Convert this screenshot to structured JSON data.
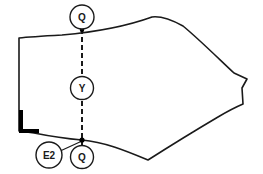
{
  "drawing": {
    "title": "Garment panel pattern piece with annotation balloons",
    "type": "technical-pattern-outline",
    "background_color": "#ffffff",
    "outline_color": "#1a1a1a",
    "balloon_fill": "#ffffff",
    "notch_color": "#000000",
    "dashed_line_color": "#1a1a1a",
    "outline": {
      "stroke_width": 1.6,
      "path": "M 19,38 L 19,131 L 34,133 C 54,137 70,139 82,140 C 104,142 124,150 148,160 C 170,146 196,130 218,117 C 228,111 236,107 243,104 L 242,88 L 247,79 L 234,73 C 222,62 200,40 183,26 C 172,20 160,16 152,17 C 130,25 96,32 62,35 C 44,36 28,37 19,38 Z"
    },
    "notch_mark": {
      "label": "corner-notch",
      "vertical": {
        "x": 19,
        "y": 110,
        "width": 4,
        "height": 23
      },
      "horizontal": {
        "x": 19,
        "y": 129,
        "width": 20,
        "height": 4
      }
    },
    "dashed_line": {
      "label": "construction-line",
      "x": 82,
      "y1": 29,
      "y2": 145,
      "dash": "5 3",
      "stroke_width": 2
    },
    "leader_line": {
      "label": "e2-leader",
      "from_x": 58,
      "from_y": 152,
      "to_x": 82,
      "to_y": 141,
      "stroke_width": 1.2
    },
    "endpoints": [
      {
        "name": "top-endpoint-marker",
        "x": 82,
        "y": 30,
        "r": 2.2
      },
      {
        "name": "bottom-endpoint-marker",
        "x": 82,
        "y": 140,
        "r": 2.6
      }
    ],
    "balloons": [
      {
        "id": "balloon-q-top",
        "label": "Q",
        "cx": 82,
        "cy": 17,
        "r": 12,
        "font_size": 10
      },
      {
        "id": "balloon-y-middle",
        "label": "Y",
        "cx": 82,
        "cy": 88,
        "r": 11.5,
        "font_size": 10
      },
      {
        "id": "balloon-e2-left",
        "label": "E2",
        "cx": 49,
        "cy": 155,
        "r": 13,
        "font_size": 10
      },
      {
        "id": "balloon-q-bottom",
        "label": "Q",
        "cx": 82,
        "cy": 157,
        "r": 11.5,
        "font_size": 10
      }
    ]
  }
}
